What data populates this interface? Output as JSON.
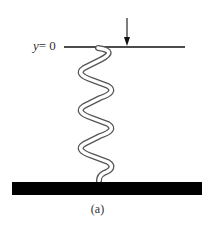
{
  "diagram": {
    "label_y_var": "y",
    "label_y_eq": "= 0",
    "caption": "(a)",
    "colors": {
      "line": "#111111",
      "spring": "#555555",
      "base": "#000000",
      "text": "#333333"
    },
    "elements": {
      "reference_line": "horizontal line at y = 0",
      "force_arrow": "downward arrow pressing on top of spring",
      "spring": "helical coil spring, 6 turns",
      "base": "solid black ground bar"
    }
  }
}
